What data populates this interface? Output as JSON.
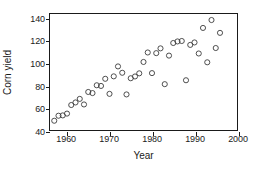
{
  "chart_data": {
    "type": "scatter",
    "title": "",
    "xlabel": "Year",
    "ylabel": "Corn yield",
    "xlim": [
      1956,
      2000
    ],
    "ylim": [
      40,
      144
    ],
    "xticks": [
      1960,
      1970,
      1980,
      1990,
      2000
    ],
    "yticks": [
      40,
      60,
      80,
      100,
      120,
      140
    ],
    "xtick_labels": [
      "1960",
      "1970",
      "1980",
      "1990",
      "2000"
    ],
    "ytick_labels": [
      "40",
      "60",
      "80",
      "100",
      "120",
      "140"
    ],
    "grid": false,
    "legend": false,
    "marker": "open-circle",
    "marker_color": "#3a3a3a",
    "marker_fill": "none",
    "marker_radius": 2.6,
    "frame_color": "#1a1a1a",
    "background_color": "#ffffff",
    "x": [
      1957,
      1958,
      1959,
      1960,
      1961,
      1962,
      1963,
      1964,
      1965,
      1966,
      1967,
      1968,
      1969,
      1970,
      1971,
      1972,
      1973,
      1974,
      1975,
      1976,
      1977,
      1978,
      1979,
      1980,
      1981,
      1982,
      1983,
      1984,
      1985,
      1986,
      1987,
      1988,
      1989,
      1990,
      1991,
      1992,
      1993,
      1994,
      1995,
      1996
    ],
    "y": [
      48.3,
      52.8,
      53.1,
      54.7,
      62.4,
      64.7,
      67.9,
      62.9,
      74.1,
      73.1,
      80.1,
      79.5,
      85.9,
      72.4,
      88.1,
      97.0,
      91.3,
      71.9,
      86.4,
      88.0,
      90.8,
      101.0,
      109.5,
      91.0,
      108.9,
      113.2,
      81.1,
      106.7,
      118.0,
      119.4,
      119.8,
      84.6,
      116.3,
      118.5,
      108.6,
      131.5,
      100.7,
      138.6,
      113.5,
      127.1
    ],
    "points": [
      {
        "x": 1957,
        "y": 48.3
      },
      {
        "x": 1958,
        "y": 52.8
      },
      {
        "x": 1959,
        "y": 53.1
      },
      {
        "x": 1960,
        "y": 54.7
      },
      {
        "x": 1961,
        "y": 62.4
      },
      {
        "x": 1962,
        "y": 64.7
      },
      {
        "x": 1963,
        "y": 67.9
      },
      {
        "x": 1964,
        "y": 62.9
      },
      {
        "x": 1965,
        "y": 74.1
      },
      {
        "x": 1966,
        "y": 73.1
      },
      {
        "x": 1967,
        "y": 80.1
      },
      {
        "x": 1968,
        "y": 79.5
      },
      {
        "x": 1969,
        "y": 85.9
      },
      {
        "x": 1970,
        "y": 72.4
      },
      {
        "x": 1971,
        "y": 88.1
      },
      {
        "x": 1972,
        "y": 97.0
      },
      {
        "x": 1973,
        "y": 91.3
      },
      {
        "x": 1974,
        "y": 71.9
      },
      {
        "x": 1975,
        "y": 86.4
      },
      {
        "x": 1976,
        "y": 88.0
      },
      {
        "x": 1977,
        "y": 90.8
      },
      {
        "x": 1978,
        "y": 101.0
      },
      {
        "x": 1979,
        "y": 109.5
      },
      {
        "x": 1980,
        "y": 91.0
      },
      {
        "x": 1981,
        "y": 108.9
      },
      {
        "x": 1982,
        "y": 113.2
      },
      {
        "x": 1983,
        "y": 81.1
      },
      {
        "x": 1984,
        "y": 106.7
      },
      {
        "x": 1985,
        "y": 118.0
      },
      {
        "x": 1986,
        "y": 119.4
      },
      {
        "x": 1987,
        "y": 119.8
      },
      {
        "x": 1988,
        "y": 84.6
      },
      {
        "x": 1989,
        "y": 116.3
      },
      {
        "x": 1990,
        "y": 118.5
      },
      {
        "x": 1991,
        "y": 108.6
      },
      {
        "x": 1992,
        "y": 131.5
      },
      {
        "x": 1993,
        "y": 100.7
      },
      {
        "x": 1994,
        "y": 138.6
      },
      {
        "x": 1995,
        "y": 113.5
      },
      {
        "x": 1996,
        "y": 127.1
      }
    ]
  }
}
